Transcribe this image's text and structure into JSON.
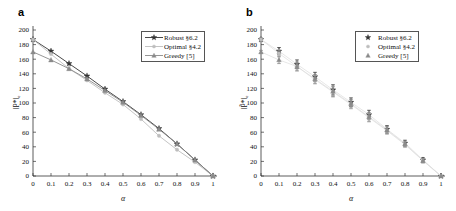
{
  "figure": {
    "panels": [
      {
        "id": "a",
        "label": "a",
        "ylabel": "‖P*‖ₑ",
        "xlabel": "α",
        "legend": [
          {
            "name": "Robust §6.2",
            "marker": "star",
            "color": "#333333",
            "line": true
          },
          {
            "name": "Optimal §4.2",
            "marker": "dot",
            "color": "#bdbdbd",
            "line": true
          },
          {
            "name": "Greedy [5]",
            "marker": "triangle",
            "color": "#8a8a8a",
            "line": true
          }
        ]
      },
      {
        "id": "b",
        "label": "b",
        "ylabel": "‖P̃*‖ₑ",
        "xlabel": "α",
        "legend": [
          {
            "name": "Robust §6.2",
            "marker": "star",
            "color": "#333333",
            "line": false
          },
          {
            "name": "Optimal §4.2",
            "marker": "dot",
            "color": "#bdbdbd",
            "line": false
          },
          {
            "name": "Greedy [5]",
            "marker": "triangle",
            "color": "#8a8a8a",
            "line": false
          }
        ]
      }
    ]
  },
  "chart_data": [
    {
      "type": "line",
      "panel": "a",
      "title": "",
      "xlabel": "α",
      "ylabel": "‖P*‖ₑ",
      "xlim": [
        0,
        1
      ],
      "ylim": [
        0,
        200
      ],
      "xticks": [
        0,
        0.1,
        0.2,
        0.3,
        0.4,
        0.5,
        0.6,
        0.7,
        0.8,
        0.9,
        1
      ],
      "xticklabels": [
        "0",
        "0.1",
        "0.2",
        "0.3",
        "0.4",
        "0.5",
        "0.6",
        "0.7",
        "0.8",
        "0.9",
        "1"
      ],
      "yticks": [
        0,
        20,
        40,
        60,
        80,
        100,
        120,
        140,
        160,
        180,
        200
      ],
      "yticklabels": [
        "0",
        "20",
        "40",
        "60",
        "80",
        "100",
        "120",
        "140",
        "160",
        "180",
        "200"
      ],
      "grid": false,
      "legend_position": "upper right",
      "x": [
        0,
        0.1,
        0.2,
        0.3,
        0.4,
        0.5,
        0.6,
        0.7,
        0.8,
        0.9,
        1
      ],
      "series": [
        {
          "name": "Robust §6.2",
          "marker": "star",
          "color": "#333333",
          "values": [
            187,
            171,
            154,
            137,
            119,
            102,
            84,
            65,
            44,
            22,
            0
          ]
        },
        {
          "name": "Optimal §4.2",
          "marker": "dot",
          "color": "#bdbdbd",
          "values": [
            187,
            167,
            147,
            131,
            114,
            98,
            78,
            55,
            36,
            19,
            0
          ]
        },
        {
          "name": "Greedy [5]",
          "marker": "triangle",
          "color": "#8a8a8a",
          "values": [
            170,
            159,
            147,
            133,
            117,
            101,
            83,
            64,
            44,
            22,
            0
          ]
        }
      ]
    },
    {
      "type": "scatter",
      "panel": "b",
      "title": "",
      "xlabel": "α",
      "ylabel": "‖P̃*‖ₑ",
      "xlim": [
        0,
        1
      ],
      "ylim": [
        0,
        200
      ],
      "xticks": [
        0,
        0.1,
        0.2,
        0.3,
        0.4,
        0.5,
        0.6,
        0.7,
        0.8,
        0.9,
        1
      ],
      "xticklabels": [
        "0",
        "0.1",
        "0.2",
        "0.3",
        "0.4",
        "0.5",
        "0.6",
        "0.7",
        "0.8",
        "0.9",
        "1"
      ],
      "yticks": [
        0,
        20,
        40,
        60,
        80,
        100,
        120,
        140,
        160,
        180,
        200
      ],
      "yticklabels": [
        "0",
        "20",
        "40",
        "60",
        "80",
        "100",
        "120",
        "140",
        "160",
        "180",
        "200"
      ],
      "grid": false,
      "legend_position": "upper right",
      "errorbars": true,
      "x": [
        0,
        0.1,
        0.2,
        0.3,
        0.4,
        0.5,
        0.6,
        0.7,
        0.8,
        0.9,
        1
      ],
      "series": [
        {
          "name": "Robust §6.2",
          "marker": "star",
          "color": "#333333",
          "values": [
            187,
            171,
            153,
            136,
            118,
            101,
            84,
            64,
            45,
            22,
            0
          ],
          "errors": [
            2,
            5,
            6,
            6,
            7,
            6,
            6,
            5,
            4,
            3,
            0
          ]
        },
        {
          "name": "Optimal §4.2",
          "marker": "dot",
          "color": "#bdbdbd",
          "values": [
            187,
            168,
            150,
            132,
            115,
            98,
            80,
            62,
            43,
            21,
            0
          ],
          "errors": [
            2,
            5,
            6,
            6,
            7,
            6,
            6,
            5,
            4,
            3,
            0
          ]
        },
        {
          "name": "Greedy [5]",
          "marker": "triangle",
          "color": "#8a8a8a",
          "values": [
            170,
            159,
            150,
            133,
            116,
            99,
            81,
            63,
            44,
            21,
            0
          ],
          "errors": [
            2,
            5,
            6,
            6,
            7,
            6,
            6,
            5,
            4,
            3,
            0
          ]
        }
      ]
    }
  ]
}
